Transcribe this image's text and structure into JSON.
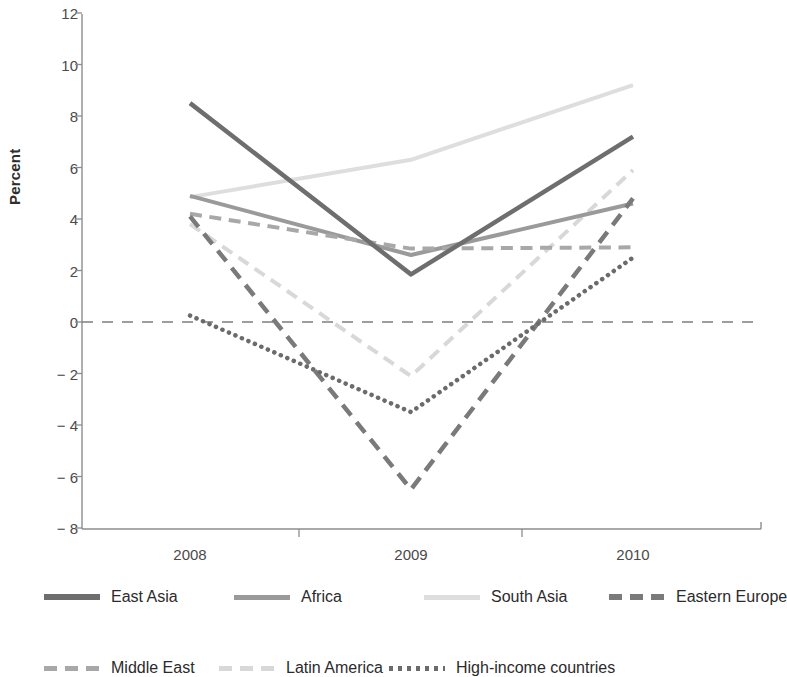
{
  "chart_data": {
    "type": "line",
    "title": "",
    "xlabel": "",
    "ylabel": "Percent",
    "categories": [
      "2008",
      "2009",
      "2010"
    ],
    "x_tick_labels": [
      "2008",
      "2009",
      "2010"
    ],
    "y_tick_labels": [
      "12",
      "10",
      "8",
      "6",
      "4",
      "2",
      "0",
      "− 2",
      "− 4",
      "− 6",
      "− 8"
    ],
    "y_tick_values": [
      12,
      10,
      8,
      6,
      4,
      2,
      0,
      -2,
      -4,
      -6,
      -8
    ],
    "ylim": [
      -8,
      12
    ],
    "grid": false,
    "zero_line": true,
    "zero_line_style": "dashed",
    "legend_position": "bottom",
    "series": [
      {
        "name": "East Asia",
        "values": [
          8.5,
          1.85,
          7.2
        ],
        "color": "#6e6e6e",
        "style": "solid",
        "width": 4.5
      },
      {
        "name": "Africa",
        "values": [
          4.9,
          2.6,
          4.6
        ],
        "color": "#9a9a9a",
        "style": "solid",
        "width": 4.0
      },
      {
        "name": "South Asia",
        "values": [
          4.85,
          6.3,
          9.2
        ],
        "color": "#dedede",
        "style": "solid",
        "width": 4.0
      },
      {
        "name": "Eastern Europe",
        "values": [
          4.1,
          -6.5,
          4.8
        ],
        "color": "#7a7a7a",
        "style": "dashed",
        "width": 4.5
      },
      {
        "name": "Middle East",
        "values": [
          4.2,
          2.85,
          2.9
        ],
        "color": "#a8a8a8",
        "style": "dashed",
        "width": 4.0
      },
      {
        "name": "Latin America",
        "values": [
          3.8,
          -2.1,
          5.9
        ],
        "color": "#d8d8d8",
        "style": "dashed",
        "width": 4.0
      },
      {
        "name": "High-income countries",
        "values": [
          0.25,
          -3.5,
          2.5
        ],
        "color": "#6b6b6b",
        "style": "dotted",
        "width": 4.5
      }
    ]
  },
  "legend": {
    "rows": [
      [
        "East Asia",
        "Africa",
        "South Asia",
        "Eastern Europe"
      ],
      [
        "Middle East",
        "Latin America",
        "High-income countries"
      ]
    ]
  },
  "axes": {
    "y_title": "Percent",
    "ticks_y": [
      "12",
      "10",
      "8",
      "6",
      "4",
      "2",
      "0",
      "− 2",
      "− 4",
      "− 6",
      "− 8"
    ],
    "ticks_x": [
      "2008",
      "2009",
      "2010"
    ]
  },
  "colors": {
    "axis": "#8d8d8d",
    "text": "#3b3b3b",
    "background": "#ffffff"
  }
}
